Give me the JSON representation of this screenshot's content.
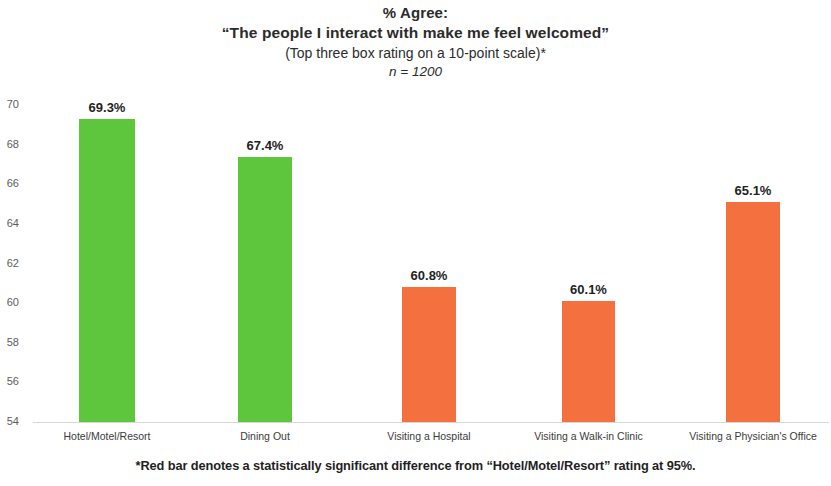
{
  "chart_data": {
    "type": "bar",
    "title": "% Agree:",
    "subtitle": "“The people I interact with make me feel welcomed”",
    "subtitle2": "(Top three box rating on a 10-point scale)*",
    "sample_size": "n = 1200",
    "categories": [
      "Hotel/Motel/Resort",
      "Dining Out",
      "Visiting a Hospital",
      "Visiting a Walk-in Clinic",
      "Visiting a Physician's Office"
    ],
    "values": [
      69.3,
      67.4,
      60.8,
      60.1,
      65.1
    ],
    "value_labels": [
      "69.3%",
      "67.4%",
      "60.8%",
      "60.1%",
      "65.1%"
    ],
    "bar_colors": [
      "#5ec63c",
      "#5ec63c",
      "#f4703f",
      "#f4703f",
      "#f4703f"
    ],
    "colors": {
      "green": "#5ec63c",
      "orange": "#f4703f",
      "axis": "#d8d8d8",
      "text": "#1f1f1f"
    },
    "xlabel": "",
    "ylabel": "",
    "ylim": [
      54,
      70
    ],
    "ytick_step": 2,
    "ytick_labels": [
      "70",
      "68",
      "66",
      "64",
      "62",
      "60",
      "58",
      "56",
      "54"
    ],
    "ytick_values": [
      70,
      68,
      66,
      64,
      62,
      60,
      58,
      56,
      54
    ],
    "grid": false,
    "legend": "none",
    "footnote": "*Red bar denotes a statistically significant difference from “Hotel/Motel/Resort” rating at 95%."
  }
}
